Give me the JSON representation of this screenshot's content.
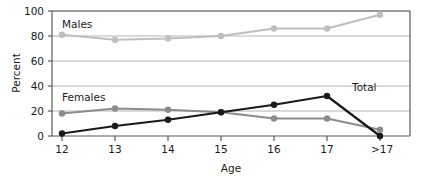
{
  "chart_data": {
    "type": "line",
    "title": "",
    "subtitle": "",
    "xlabel": "Age",
    "ylabel": "Percent",
    "categories": [
      "12",
      "13",
      "14",
      "15",
      "16",
      "17",
      ">17"
    ],
    "ylim": [
      0,
      100
    ],
    "yticks": [
      0,
      20,
      40,
      60,
      80,
      100
    ],
    "ytick_labels": [
      "0",
      "20",
      "40",
      "60",
      "80",
      "100"
    ],
    "grid": true,
    "grid_axis": "y",
    "legend": "inline-labels",
    "series": [
      {
        "name": "Males",
        "values": [
          81,
          77,
          78,
          80,
          86,
          86,
          97
        ],
        "color": "#bfbfbf",
        "marker": "circle",
        "label_x": 15,
        "label_y": 92
      },
      {
        "name": "Females",
        "values": [
          18,
          22,
          21,
          19,
          14,
          14,
          5
        ],
        "color": "#8c8c8c",
        "marker": "circle",
        "label_x": 15,
        "label_y": 32
      },
      {
        "name": "Total",
        "values": [
          2,
          8,
          13,
          19,
          25,
          32,
          0
        ],
        "color": "#1a1a1a",
        "marker": "circle",
        "label_x": 352,
        "label_y": 36
      }
    ]
  },
  "axes": {
    "y_title": "Percent",
    "x_title": "Age",
    "y_tick_0": "0",
    "y_tick_20": "20",
    "y_tick_40": "40",
    "y_tick_60": "60",
    "y_tick_80": "80",
    "y_tick_100": "100",
    "x_tick_0": "12",
    "x_tick_1": "13",
    "x_tick_2": "14",
    "x_tick_3": "15",
    "x_tick_4": "16",
    "x_tick_5": "17",
    "x_tick_6": ">17"
  },
  "labels": {
    "males": "Males",
    "females": "Females",
    "total": "Total"
  },
  "colors": {
    "males_line": "#bfbfbf",
    "females_line": "#8c8c8c",
    "total_line": "#1a1a1a",
    "grid": "#b5b5b5",
    "frame": "#5a5a5a",
    "background": "#ffffff",
    "text": "#1a1a1a"
  }
}
